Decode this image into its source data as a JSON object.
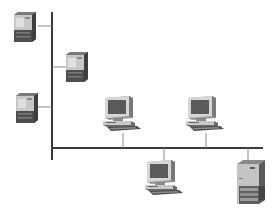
{
  "diagram": {
    "type": "network-topology",
    "colors": {
      "background": "#ffffff",
      "bus_line": "#3a3a3a",
      "stub_line": "#8a8a8a",
      "device_light": "#d4d4d4",
      "device_mid": "#9a9a9a",
      "device_dark": "#4a4a4a",
      "screen": "#5a5a5a"
    },
    "buses": [
      {
        "id": "vertical-bus",
        "x1": 52,
        "y1": 12,
        "x2": 52,
        "y2": 160
      },
      {
        "id": "horizontal-bus",
        "x1": 52,
        "y1": 148,
        "x2": 263,
        "y2": 148
      }
    ],
    "nodes": [
      {
        "id": "tower-1",
        "kind": "tower",
        "x": 14,
        "y": 12,
        "w": 22,
        "h": 30
      },
      {
        "id": "tower-2",
        "kind": "tower",
        "x": 66,
        "y": 52,
        "w": 22,
        "h": 30
      },
      {
        "id": "tower-3",
        "kind": "tower",
        "x": 16,
        "y": 93,
        "w": 22,
        "h": 30
      },
      {
        "id": "workstation-1",
        "kind": "workstation",
        "x": 103,
        "y": 95
      },
      {
        "id": "workstation-2",
        "kind": "workstation",
        "x": 186,
        "y": 95
      },
      {
        "id": "workstation-3",
        "kind": "workstation",
        "x": 145,
        "y": 160
      },
      {
        "id": "server",
        "kind": "server",
        "x": 237,
        "y": 160,
        "w": 28,
        "h": 44
      }
    ],
    "links": [
      {
        "from": "tower-1",
        "x1": 38,
        "y1": 26,
        "x2": 52,
        "y2": 26
      },
      {
        "from": "tower-2",
        "x1": 52,
        "y1": 67,
        "x2": 66,
        "y2": 67
      },
      {
        "from": "tower-3",
        "x1": 38,
        "y1": 107,
        "x2": 52,
        "y2": 107
      },
      {
        "from": "workstation-1",
        "x1": 123,
        "y1": 133,
        "x2": 123,
        "y2": 148
      },
      {
        "from": "workstation-2",
        "x1": 206,
        "y1": 133,
        "x2": 206,
        "y2": 148
      },
      {
        "from": "workstation-3",
        "x1": 164,
        "y1": 148,
        "x2": 164,
        "y2": 160
      },
      {
        "from": "server",
        "x1": 248,
        "y1": 148,
        "x2": 248,
        "y2": 160
      }
    ]
  }
}
